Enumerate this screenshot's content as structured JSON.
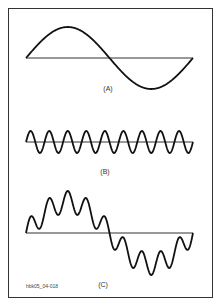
{
  "figure": {
    "id_label": "hbk05_04-018",
    "panels": [
      {
        "label": "(A)",
        "description": "fundamental sine wave",
        "cycles": 1,
        "amplitude": 31
      },
      {
        "label": "(B)",
        "description": "fifth harmonic sine wave",
        "cycles": 9,
        "amplitude": 11
      },
      {
        "label": "(C)",
        "description": "sum of fundamental and harmonic",
        "cycles": 1,
        "amplitude": 31,
        "harmonic_cycles": 9,
        "harmonic_amplitude": 11
      }
    ]
  }
}
